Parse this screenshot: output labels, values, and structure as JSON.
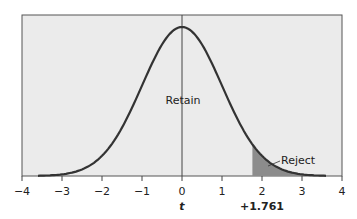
{
  "chart_data": {
    "type": "line",
    "title": "",
    "xlabel": "t",
    "ylabel": "",
    "xlim": [
      -4,
      4
    ],
    "xticks": [
      -4,
      -3,
      -2,
      -1,
      0,
      1,
      2,
      3,
      4
    ],
    "xtick_labels": [
      "−4",
      "−3",
      "−2",
      "−1",
      "0",
      "1",
      "2",
      "3",
      "4"
    ],
    "grid": false,
    "legend": null,
    "series": [
      {
        "name": "t-distribution (density)",
        "x": [
          -3.5,
          -3,
          -2.5,
          -2,
          -1.5,
          -1,
          -0.5,
          0,
          0.5,
          1,
          1.5,
          2,
          2.5,
          3,
          3.5
        ],
        "values": [
          0.002,
          0.006,
          0.02,
          0.058,
          0.127,
          0.23,
          0.34,
          0.388,
          0.34,
          0.23,
          0.127,
          0.058,
          0.02,
          0.006,
          0.002
        ]
      }
    ],
    "critical_value": 1.761,
    "critical_label": "+1.761",
    "annotations": [
      {
        "text": "Retain",
        "x": 0,
        "region": "retain"
      },
      {
        "text": "Reject",
        "x": 2.3,
        "region": "reject",
        "shaded_from": 1.761
      }
    ],
    "colors": {
      "plot_background": "#ebebeb",
      "curve": "#333333",
      "reject_fill": "#8c8c8c",
      "frame": "#555555"
    }
  },
  "labels": {
    "retain": "Retain",
    "reject": "Reject",
    "x_title": "t",
    "critical": "+1.761",
    "ticks": [
      "−4",
      "−3",
      "−2",
      "−1",
      "0",
      "1",
      "2",
      "3",
      "4"
    ]
  }
}
